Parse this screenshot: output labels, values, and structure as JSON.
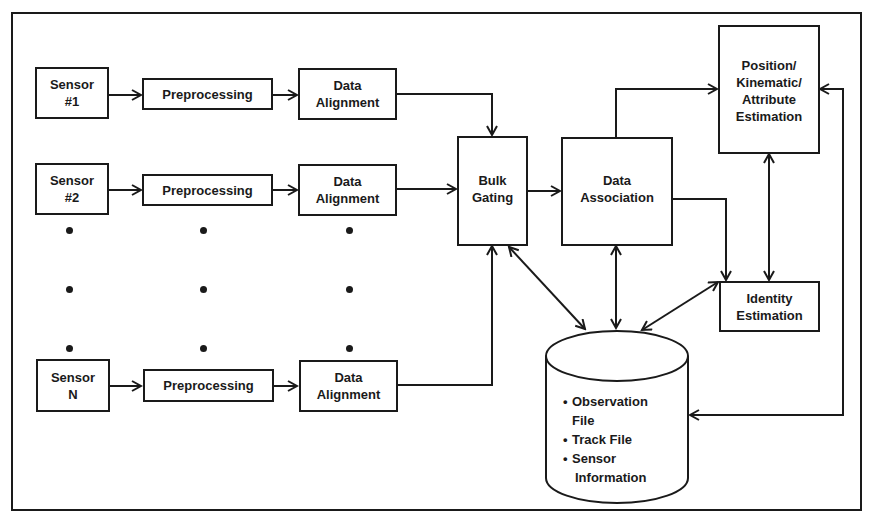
{
  "diagram": {
    "sensors": [
      {
        "sensor": "Sensor\n#1",
        "preprocessing": "Preprocessing",
        "alignment": "Data\nAlignment"
      },
      {
        "sensor": "Sensor\n#2",
        "preprocessing": "Preprocessing",
        "alignment": "Data\nAlignment"
      },
      {
        "sensor": "Sensor\nN",
        "preprocessing": "Preprocessing",
        "alignment": "Data\nAlignment"
      }
    ],
    "bulk_gating": "Bulk\nGating",
    "data_association": "Data\nAssociation",
    "position_estimation": "Position/\nKinematic/\nAttribute\nEstimation",
    "identity_estimation": "Identity\nEstimation",
    "database": {
      "items": [
        {
          "bullet": "•",
          "line1": "Observation",
          "line2": "File"
        },
        {
          "bullet": "•",
          "line1": "Track File",
          "line2": ""
        },
        {
          "bullet": "•",
          "line1": "Sensor",
          "line2": "Information"
        }
      ]
    },
    "colors": {
      "stroke": "#1a1a1a",
      "background": "#ffffff"
    }
  }
}
